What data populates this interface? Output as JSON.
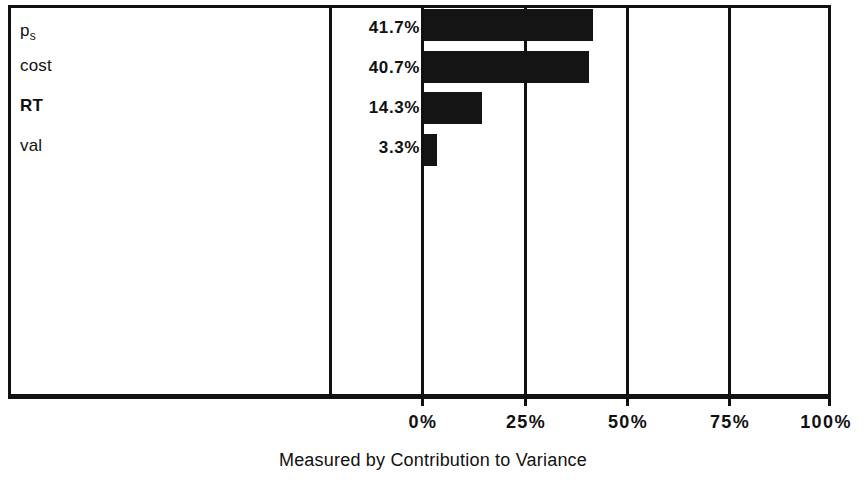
{
  "chart_data": {
    "type": "bar",
    "orientation": "horizontal",
    "title": "",
    "subtitle": "",
    "xlabel": "Measured by Contribution to Variance",
    "ylabel": "",
    "categories": [
      "p_s",
      "cost",
      "RT",
      "val"
    ],
    "category_labels": [
      "p",
      "cost",
      "RT",
      "val"
    ],
    "values": [
      41.7,
      40.7,
      14.3,
      3.3
    ],
    "value_labels": [
      "41.7%",
      "40.7%",
      "14.3%",
      "3.3%"
    ],
    "xlim": [
      0,
      100
    ],
    "xticks": [
      0,
      25,
      50,
      75,
      100
    ],
    "xtick_labels": [
      "0%",
      "25%",
      "50%",
      "75%",
      "100%"
    ],
    "grid": true,
    "legend": null,
    "bar_color": "#141414",
    "frame_color": "#111111",
    "background": "#ffffff"
  },
  "rows": [
    {
      "label": "p",
      "sub": "s",
      "bold": false,
      "pct": "41.7%",
      "value": 41.7
    },
    {
      "label": "cost",
      "sub": "",
      "bold": false,
      "pct": "40.7%",
      "value": 40.7
    },
    {
      "label": "RT",
      "sub": "",
      "bold": true,
      "pct": "14.3%",
      "value": 14.3
    },
    {
      "label": "val",
      "sub": "",
      "bold": false,
      "pct": "3.3%",
      "value": 3.3
    }
  ],
  "axis": {
    "caption": "Measured by Contribution to Variance",
    "ticks": [
      {
        "label": "0%",
        "value": 0
      },
      {
        "label": "25%",
        "value": 25
      },
      {
        "label": "50%",
        "value": 50
      },
      {
        "label": "75%",
        "value": 75
      },
      {
        "label": "100%",
        "value": 100
      }
    ]
  }
}
